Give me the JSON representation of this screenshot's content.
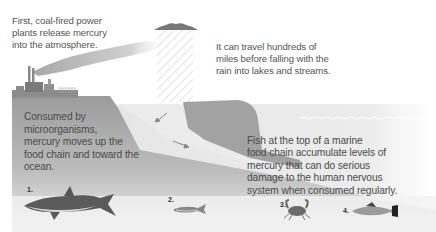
{
  "captions": {
    "step1": [
      "First, coal-fired power",
      "plants release mercury",
      "into the atmosphere."
    ],
    "step2": [
      "It can travel hundreds of",
      "miles before falling with the",
      "rain into lakes and streams."
    ],
    "step3": [
      "Consumed by",
      "microorganisms,",
      "mercury moves up the",
      "food chain and toward the",
      "ocean."
    ],
    "step4": [
      "Fish at the top of a marine",
      "food chain accumulate levels of",
      "mercury that can do serious",
      "damage to the human nervous",
      "system when consumed regularly."
    ]
  },
  "creatures": [
    {
      "number": "1.",
      "name": "shark"
    },
    {
      "number": "2.",
      "name": "small fish"
    },
    {
      "number": "3.",
      "name": "crab"
    },
    {
      "number": "4.",
      "name": "trout"
    }
  ],
  "colors": {
    "land": "#9a9a9a",
    "water": "#e2e2e2",
    "smoke": "#bdbdbd",
    "cloud": "#7a7a7a",
    "text": "#555555"
  }
}
